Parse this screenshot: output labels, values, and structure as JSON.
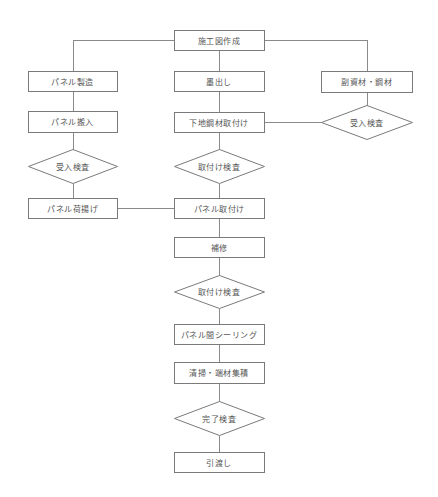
{
  "diagram": {
    "type": "flowchart",
    "colors": {
      "line": "#8a8a8a",
      "border": "#7a7a7a",
      "text": "#555555",
      "background": "#ffffff"
    },
    "nodes": [
      {
        "id": "n_shokouzu",
        "label": "施工図作成",
        "shape": "rect",
        "x": 174,
        "y": 30,
        "w": 90,
        "h": 20
      },
      {
        "id": "n_panel_seizo",
        "label": "パネル製造",
        "shape": "rect",
        "x": 28,
        "y": 71,
        "w": 89,
        "h": 20
      },
      {
        "id": "n_sumidashi",
        "label": "墨出し",
        "shape": "rect",
        "x": 174,
        "y": 71,
        "w": 90,
        "h": 20
      },
      {
        "id": "n_fukushizai",
        "label": "副資材・鋼材",
        "shape": "rect",
        "x": 321,
        "y": 71,
        "w": 91,
        "h": 21
      },
      {
        "id": "n_panel_hannyu",
        "label": "パネル搬入",
        "shape": "rect",
        "x": 28,
        "y": 111,
        "w": 89,
        "h": 21
      },
      {
        "id": "n_shitaji",
        "label": "下地鋼材取付け",
        "shape": "rect",
        "x": 174,
        "y": 112,
        "w": 90,
        "h": 20
      },
      {
        "id": "n_ukeire_right",
        "label": "受入検査",
        "shape": "diamond",
        "x": 321,
        "y": 105,
        "w": 91,
        "h": 34
      },
      {
        "id": "n_ukeire_left",
        "label": "受入検査",
        "shape": "diamond",
        "x": 28,
        "y": 149,
        "w": 89,
        "h": 34
      },
      {
        "id": "n_toritsuke_kensa1",
        "label": "取付け検査",
        "shape": "diamond",
        "x": 174,
        "y": 149,
        "w": 90,
        "h": 34
      },
      {
        "id": "n_niage",
        "label": "パネル荷揚げ",
        "shape": "rect",
        "x": 28,
        "y": 198,
        "w": 89,
        "h": 20
      },
      {
        "id": "n_panel_toritsuke",
        "label": "パネル取付け",
        "shape": "rect",
        "x": 174,
        "y": 198,
        "w": 90,
        "h": 20
      },
      {
        "id": "n_hoshu",
        "label": "補修",
        "shape": "rect",
        "x": 174,
        "y": 237,
        "w": 90,
        "h": 20
      },
      {
        "id": "n_toritsuke_kensa2",
        "label": "取付け検査",
        "shape": "diamond",
        "x": 174,
        "y": 275,
        "w": 90,
        "h": 33
      },
      {
        "id": "n_sealing",
        "label": "パネル間シーリング",
        "shape": "rect",
        "x": 174,
        "y": 324,
        "w": 90,
        "h": 20
      },
      {
        "id": "n_seisou",
        "label": "清掃・端材集積",
        "shape": "rect",
        "x": 174,
        "y": 362,
        "w": 90,
        "h": 21
      },
      {
        "id": "n_kanryo",
        "label": "完了検査",
        "shape": "diamond",
        "x": 174,
        "y": 401,
        "w": 90,
        "h": 34
      },
      {
        "id": "n_hikiwatashi",
        "label": "引渡し",
        "shape": "rect",
        "x": 174,
        "y": 452,
        "w": 90,
        "h": 20
      }
    ],
    "edges": [
      {
        "points": [
          [
            174,
            40
          ],
          [
            73,
            40
          ],
          [
            73,
            71
          ]
        ]
      },
      {
        "points": [
          [
            264,
            40
          ],
          [
            367,
            40
          ],
          [
            367,
            71
          ]
        ]
      },
      {
        "points": [
          [
            219,
            50
          ],
          [
            219,
            71
          ]
        ]
      },
      {
        "points": [
          [
            73,
            91
          ],
          [
            73,
            111
          ]
        ]
      },
      {
        "points": [
          [
            219,
            91
          ],
          [
            219,
            112
          ]
        ]
      },
      {
        "points": [
          [
            367,
            92
          ],
          [
            367,
            105
          ]
        ]
      },
      {
        "points": [
          [
            321,
            122
          ],
          [
            264,
            122
          ]
        ]
      },
      {
        "points": [
          [
            73,
            132
          ],
          [
            73,
            149
          ]
        ]
      },
      {
        "points": [
          [
            219,
            132
          ],
          [
            219,
            149
          ]
        ]
      },
      {
        "points": [
          [
            73,
            183
          ],
          [
            73,
            198
          ]
        ]
      },
      {
        "points": [
          [
            219,
            183
          ],
          [
            219,
            198
          ]
        ]
      },
      {
        "points": [
          [
            117,
            208
          ],
          [
            174,
            208
          ]
        ]
      },
      {
        "points": [
          [
            219,
            218
          ],
          [
            219,
            237
          ]
        ]
      },
      {
        "points": [
          [
            219,
            257
          ],
          [
            219,
            275
          ]
        ]
      },
      {
        "points": [
          [
            219,
            308
          ],
          [
            219,
            324
          ]
        ]
      },
      {
        "points": [
          [
            219,
            344
          ],
          [
            219,
            362
          ]
        ]
      },
      {
        "points": [
          [
            219,
            383
          ],
          [
            219,
            401
          ]
        ]
      },
      {
        "points": [
          [
            219,
            435
          ],
          [
            219,
            452
          ]
        ]
      }
    ]
  }
}
